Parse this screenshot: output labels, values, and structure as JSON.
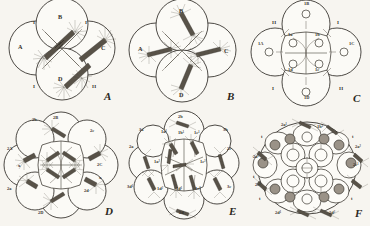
{
  "plate": {
    "title": "Cell lineage cleavage plate",
    "description": "Six camera-lucida drawings of cleaving eggs, A through F, showing mitotic spindles, asters and blastomere lineage designations.",
    "background_color": "#f7f5f0",
    "ink_color": "#2e2b26"
  },
  "panels": [
    {
      "id": "A",
      "letter": "A",
      "stage_note": "four-cell stage, first quartet spindles forming",
      "cell_labels": [
        "A",
        "B",
        "C",
        "D"
      ],
      "polar_labels": [
        "I",
        "I",
        "I",
        "II",
        "II"
      ]
    },
    {
      "id": "B",
      "letter": "B",
      "stage_note": "four-cell stage, spindles rotated",
      "cell_labels": [
        "A",
        "B",
        "C",
        "D"
      ],
      "polar_labels": []
    },
    {
      "id": "C",
      "letter": "C",
      "stage_note": "eight-cell stage, first quartet formed",
      "cell_labels": [
        "1A",
        "1B",
        "1C",
        "1D",
        "1a",
        "1b",
        "1c",
        "1d"
      ],
      "polar_labels": [
        "I",
        "I",
        "II",
        "II"
      ]
    },
    {
      "id": "D",
      "letter": "D",
      "stage_note": "twelve-cell stage, second quartet forming",
      "cell_labels": [
        "2A",
        "2B",
        "2C",
        "2D",
        "2a",
        "2b",
        "2c",
        "2d"
      ],
      "polar_labels": [
        "x",
        "x"
      ]
    },
    {
      "id": "E",
      "letter": "E",
      "stage_note": "second quartet divided, derivatives of first quartet",
      "cell_labels": [
        "2a",
        "2b",
        "2c",
        "2d",
        "3a",
        "3b",
        "3c",
        "3d¹",
        "1a¹",
        "1b¹",
        "1c¹",
        "1d¹",
        "1a²",
        "1c²",
        "1d²"
      ],
      "polar_labels": []
    },
    {
      "id": "F",
      "letter": "F",
      "stage_note": "later stage, trochoblasts marked t",
      "cell_labels": [
        "1b¹",
        "2a¹",
        "2a²",
        "2c¹",
        "2c²",
        "2d¹",
        "2d²"
      ],
      "polar_labels": [
        "t",
        "t",
        "t",
        "t",
        "t",
        "t"
      ]
    }
  ]
}
